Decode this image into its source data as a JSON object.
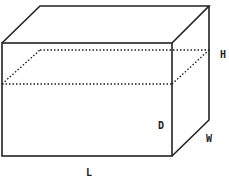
{
  "diagram": {
    "type": "rectangular-prism-with-water-level",
    "colors": {
      "stroke": "#222222",
      "background": "#ffffff"
    },
    "labels": {
      "height": "H",
      "depth": "D",
      "width": "W",
      "length": "L"
    }
  }
}
